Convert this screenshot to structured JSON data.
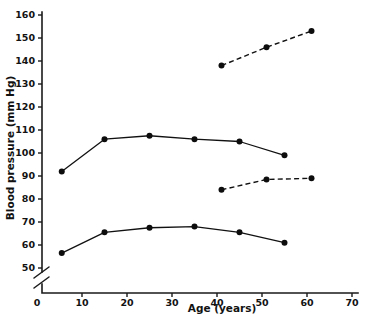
{
  "chart_data": {
    "type": "line",
    "title": "",
    "xlabel": "Age (years)",
    "ylabel": "Blood pressure (mm Hg)",
    "xlim": [
      0,
      72
    ],
    "ylim": [
      48,
      163
    ],
    "xticks": [
      0,
      10,
      20,
      30,
      40,
      50,
      60,
      70
    ],
    "xtick_labels": [
      "0",
      "10",
      "20",
      "30",
      "40",
      "50",
      "60",
      "70"
    ],
    "yticks": [
      50,
      60,
      70,
      80,
      90,
      100,
      110,
      120,
      130,
      140,
      150,
      160
    ],
    "ytick_labels": [
      "50",
      "60",
      "70",
      "80",
      "90",
      "100",
      "110",
      "120",
      "130",
      "140",
      "150",
      "160"
    ],
    "grid": false,
    "legend": "none",
    "axis_break": {
      "axis": "y",
      "present": true,
      "note": "double-slash break between 0 and 50 on the y-axis"
    },
    "series": [
      {
        "name": "Systolic blood pressure (solid)",
        "style": "solid",
        "marker": "filled-circle",
        "x": [
          5.5,
          15,
          25,
          35,
          45,
          55
        ],
        "y": [
          92,
          106,
          107.5,
          106,
          105,
          99
        ]
      },
      {
        "name": "Systolic blood pressure, older ages (dashed)",
        "style": "dashed",
        "marker": "filled-circle",
        "x": [
          41,
          51,
          61
        ],
        "y": [
          138,
          146,
          153
        ]
      },
      {
        "name": "Diastolic blood pressure (solid)",
        "style": "solid",
        "marker": "filled-circle",
        "x": [
          5.5,
          15,
          25,
          35,
          45,
          55
        ],
        "y": [
          56.5,
          65.5,
          67.5,
          68,
          65.5,
          61
        ]
      },
      {
        "name": "Diastolic blood pressure, older ages (dashed)",
        "style": "dashed",
        "marker": "filled-circle",
        "x": [
          41,
          51,
          61
        ],
        "y": [
          84,
          88.5,
          89
        ]
      }
    ]
  },
  "colors": {
    "axis": "#1a1a1a",
    "series": "#111111",
    "background": "#ffffff",
    "text": "#121212"
  }
}
